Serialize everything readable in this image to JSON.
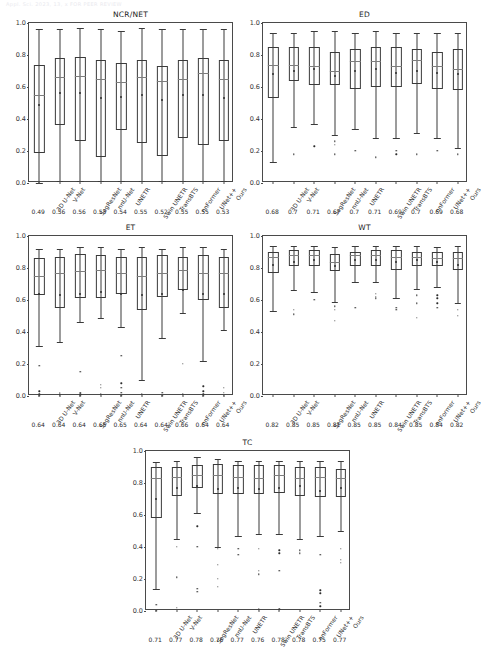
{
  "page": {
    "header_text": "Appl. Sci.  2023, 13, x FOR PEER REVIEW",
    "y_ticks": [
      "0.0",
      "0.2",
      "0.4",
      "0.6",
      "0.8",
      "1.0"
    ]
  },
  "methods": [
    "3D U-Net",
    "V-Net",
    "SegResNet",
    "nnU-Net",
    "UNETR",
    "Swin UNETR",
    "TransBTS",
    "nnFormer",
    "UNet++",
    "Ours"
  ],
  "chart_data": [
    {
      "type": "box",
      "title": "NCR/NET",
      "xlabel": "",
      "ylabel": "",
      "ylim": [
        0.0,
        1.0
      ],
      "yticks": [
        0.0,
        0.2,
        0.4,
        0.6,
        0.8,
        1.0
      ],
      "grid": false,
      "legend": "none",
      "categories": [
        "3D U-Net",
        "V-Net",
        "SegResNet",
        "nnU-Net",
        "UNETR",
        "Swin UNETR",
        "TransBTS",
        "nnFormer",
        "UNet++",
        "Ours"
      ],
      "mean_labels": [
        "0.49",
        "0.56",
        "0.56",
        "0.53",
        "0.54",
        "0.55",
        "0.52",
        "0.55",
        "0.55",
        "0.53"
      ],
      "boxes": [
        {
          "whisker_low": 0.0,
          "q1": 0.19,
          "median": 0.55,
          "q3": 0.74,
          "whisker_high": 0.96,
          "mean": 0.49,
          "fliers": []
        },
        {
          "whisker_low": 0.01,
          "q1": 0.36,
          "median": 0.66,
          "q3": 0.78,
          "whisker_high": 0.96,
          "mean": 0.56,
          "fliers": []
        },
        {
          "whisker_low": 0.01,
          "q1": 0.26,
          "median": 0.67,
          "q3": 0.79,
          "whisker_high": 0.97,
          "mean": 0.56,
          "fliers": []
        },
        {
          "whisker_low": 0.01,
          "q1": 0.16,
          "median": 0.65,
          "q3": 0.77,
          "whisker_high": 0.96,
          "mean": 0.53,
          "fliers": []
        },
        {
          "whisker_low": 0.01,
          "q1": 0.33,
          "median": 0.63,
          "q3": 0.75,
          "whisker_high": 0.95,
          "mean": 0.54,
          "fliers": []
        },
        {
          "whisker_low": 0.01,
          "q1": 0.25,
          "median": 0.66,
          "q3": 0.77,
          "whisker_high": 0.97,
          "mean": 0.55,
          "fliers": []
        },
        {
          "whisker_low": 0.01,
          "q1": 0.17,
          "median": 0.64,
          "q3": 0.73,
          "whisker_high": 0.96,
          "mean": 0.52,
          "fliers": []
        },
        {
          "whisker_low": 0.01,
          "q1": 0.28,
          "median": 0.65,
          "q3": 0.77,
          "whisker_high": 0.96,
          "mean": 0.55,
          "fliers": []
        },
        {
          "whisker_low": 0.01,
          "q1": 0.24,
          "median": 0.69,
          "q3": 0.78,
          "whisker_high": 0.96,
          "mean": 0.55,
          "fliers": []
        },
        {
          "whisker_low": 0.01,
          "q1": 0.26,
          "median": 0.65,
          "q3": 0.77,
          "whisker_high": 0.96,
          "mean": 0.53,
          "fliers": []
        }
      ]
    },
    {
      "type": "box",
      "title": "ED",
      "xlabel": "",
      "ylabel": "",
      "ylim": [
        0.0,
        1.0
      ],
      "yticks": [
        0.0,
        0.2,
        0.4,
        0.6,
        0.8,
        1.0
      ],
      "grid": false,
      "legend": "none",
      "categories": [
        "3D U-Net",
        "V-Net",
        "SegResNet",
        "nnU-Net",
        "UNETR",
        "Swin UNETR",
        "TransBTS",
        "nnFormer",
        "UNet++",
        "Ours"
      ],
      "mean_labels": [
        "0.68",
        "0.7",
        "0.71",
        "0.67",
        "0.7",
        "0.71",
        "0.69",
        "0.7",
        "0.69",
        "0.68"
      ],
      "boxes": [
        {
          "whisker_low": 0.13,
          "q1": 0.53,
          "median": 0.74,
          "q3": 0.85,
          "whisker_high": 0.94,
          "mean": 0.68,
          "fliers": []
        },
        {
          "whisker_low": 0.35,
          "q1": 0.64,
          "median": 0.74,
          "q3": 0.85,
          "whisker_high": 0.94,
          "mean": 0.7,
          "fliers": [
            0.18
          ]
        },
        {
          "whisker_low": 0.37,
          "q1": 0.61,
          "median": 0.73,
          "q3": 0.85,
          "whisker_high": 0.95,
          "mean": 0.71,
          "fliers": [
            0.23
          ]
        },
        {
          "whisker_low": 0.3,
          "q1": 0.61,
          "median": 0.7,
          "q3": 0.82,
          "whisker_high": 0.95,
          "mean": 0.67,
          "fliers": [
            0.26,
            0.24,
            0.18
          ]
        },
        {
          "whisker_low": 0.34,
          "q1": 0.59,
          "median": 0.76,
          "q3": 0.84,
          "whisker_high": 0.94,
          "mean": 0.7,
          "fliers": [
            0.2
          ]
        },
        {
          "whisker_low": 0.28,
          "q1": 0.6,
          "median": 0.76,
          "q3": 0.85,
          "whisker_high": 0.95,
          "mean": 0.71,
          "fliers": [
            0.16
          ]
        },
        {
          "whisker_low": 0.28,
          "q1": 0.6,
          "median": 0.73,
          "q3": 0.85,
          "whisker_high": 0.94,
          "mean": 0.69,
          "fliers": [
            0.2,
            0.18
          ]
        },
        {
          "whisker_low": 0.31,
          "q1": 0.62,
          "median": 0.77,
          "q3": 0.84,
          "whisker_high": 0.94,
          "mean": 0.7,
          "fliers": [
            0.18
          ]
        },
        {
          "whisker_low": 0.28,
          "q1": 0.59,
          "median": 0.73,
          "q3": 0.82,
          "whisker_high": 0.94,
          "mean": 0.69,
          "fliers": [
            0.2
          ]
        },
        {
          "whisker_low": 0.22,
          "q1": 0.58,
          "median": 0.71,
          "q3": 0.84,
          "whisker_high": 0.94,
          "mean": 0.68,
          "fliers": [
            0.18
          ]
        }
      ]
    },
    {
      "type": "box",
      "title": "ET",
      "xlabel": "",
      "ylabel": "",
      "ylim": [
        0.0,
        1.0
      ],
      "yticks": [
        0.0,
        0.2,
        0.4,
        0.6,
        0.8,
        1.0
      ],
      "grid": false,
      "legend": "none",
      "categories": [
        "3D U-Net",
        "V-Net",
        "SegResNet",
        "nnU-Net",
        "UNETR",
        "Swin UNETR",
        "TransBTS",
        "nnFormer",
        "UNet++",
        "Ours"
      ],
      "mean_labels": [
        "0.64",
        "0.64",
        "0.64",
        "0.65",
        "0.65",
        "0.64",
        "0.64",
        "0.66",
        "0.64",
        "0.64"
      ],
      "boxes": [
        {
          "whisker_low": 0.31,
          "q1": 0.63,
          "median": 0.75,
          "q3": 0.86,
          "whisker_high": 0.92,
          "mean": 0.64,
          "fliers": [
            0.19,
            0.03,
            0.01,
            0.0
          ]
        },
        {
          "whisker_low": 0.34,
          "q1": 0.55,
          "median": 0.77,
          "q3": 0.87,
          "whisker_high": 0.92,
          "mean": 0.63,
          "fliers": [
            0.02,
            0.01,
            0.0
          ]
        },
        {
          "whisker_low": 0.46,
          "q1": 0.61,
          "median": 0.78,
          "q3": 0.89,
          "whisker_high": 0.93,
          "mean": 0.64,
          "fliers": [
            0.15,
            0.02,
            0.01,
            0.0
          ]
        },
        {
          "whisker_low": 0.49,
          "q1": 0.61,
          "median": 0.79,
          "q3": 0.88,
          "whisker_high": 0.93,
          "mean": 0.65,
          "fliers": [
            0.07,
            0.05,
            0.01
          ]
        },
        {
          "whisker_low": 0.43,
          "q1": 0.64,
          "median": 0.77,
          "q3": 0.87,
          "whisker_high": 0.92,
          "mean": 0.64,
          "fliers": [
            0.25,
            0.08,
            0.05,
            0.02,
            0.0
          ]
        },
        {
          "whisker_low": 0.1,
          "q1": 0.54,
          "median": 0.75,
          "q3": 0.87,
          "whisker_high": 0.93,
          "mean": 0.63,
          "fliers": [
            0.01
          ]
        },
        {
          "whisker_low": 0.36,
          "q1": 0.62,
          "median": 0.77,
          "q3": 0.88,
          "whisker_high": 0.92,
          "mean": 0.64,
          "fliers": [
            0.02,
            0.0
          ]
        },
        {
          "whisker_low": 0.52,
          "q1": 0.66,
          "median": 0.79,
          "q3": 0.87,
          "whisker_high": 0.93,
          "mean": 0.66,
          "fliers": [
            0.2,
            0.01
          ]
        },
        {
          "whisker_low": 0.22,
          "q1": 0.6,
          "median": 0.77,
          "q3": 0.88,
          "whisker_high": 0.93,
          "mean": 0.64,
          "fliers": [
            0.06,
            0.03,
            0.01,
            0.0
          ]
        },
        {
          "whisker_low": 0.41,
          "q1": 0.55,
          "median": 0.77,
          "q3": 0.87,
          "whisker_high": 0.92,
          "mean": 0.64,
          "fliers": [
            0.05,
            0.02,
            0.0
          ]
        }
      ]
    },
    {
      "type": "box",
      "title": "WT",
      "xlabel": "",
      "ylabel": "",
      "ylim": [
        0.0,
        1.0
      ],
      "yticks": [
        0.0,
        0.2,
        0.4,
        0.6,
        0.8,
        1.0
      ],
      "grid": false,
      "legend": "none",
      "categories": [
        "3D U-Net",
        "V-Net",
        "SegResNet",
        "nnU-Net",
        "UNETR",
        "Swin UNETR",
        "TransBTS",
        "nnFormer",
        "UNet++",
        "Ours"
      ],
      "mean_labels": [
        "0.82",
        "0.85",
        "0.85",
        "0.81",
        "0.85",
        "0.85",
        "0.84",
        "0.85",
        "0.84",
        "0.82"
      ],
      "boxes": [
        {
          "whisker_low": 0.53,
          "q1": 0.77,
          "median": 0.87,
          "q3": 0.9,
          "whisker_high": 0.94,
          "mean": 0.82,
          "fliers": []
        },
        {
          "whisker_low": 0.66,
          "q1": 0.81,
          "median": 0.88,
          "q3": 0.91,
          "whisker_high": 0.94,
          "mean": 0.84,
          "fliers": [
            0.54,
            0.51
          ]
        },
        {
          "whisker_low": 0.65,
          "q1": 0.81,
          "median": 0.88,
          "q3": 0.91,
          "whisker_high": 0.94,
          "mean": 0.85,
          "fliers": [
            0.6
          ]
        },
        {
          "whisker_low": 0.59,
          "q1": 0.78,
          "median": 0.84,
          "q3": 0.89,
          "whisker_high": 0.93,
          "mean": 0.81,
          "fliers": [
            0.56,
            0.54,
            0.47
          ]
        },
        {
          "whisker_low": 0.71,
          "q1": 0.81,
          "median": 0.88,
          "q3": 0.9,
          "whisker_high": 0.94,
          "mean": 0.85,
          "fliers": [
            0.55
          ]
        },
        {
          "whisker_low": 0.71,
          "q1": 0.81,
          "median": 0.88,
          "q3": 0.91,
          "whisker_high": 0.94,
          "mean": 0.85,
          "fliers": [
            0.64,
            0.62,
            0.61
          ]
        },
        {
          "whisker_low": 0.61,
          "q1": 0.79,
          "median": 0.87,
          "q3": 0.91,
          "whisker_high": 0.94,
          "mean": 0.84,
          "fliers": [
            0.55,
            0.54
          ]
        },
        {
          "whisker_low": 0.67,
          "q1": 0.81,
          "median": 0.87,
          "q3": 0.9,
          "whisker_high": 0.94,
          "mean": 0.85,
          "fliers": [
            0.63,
            0.58,
            0.49
          ]
        },
        {
          "whisker_low": 0.68,
          "q1": 0.81,
          "median": 0.86,
          "q3": 0.9,
          "whisker_high": 0.93,
          "mean": 0.84,
          "fliers": [
            0.63,
            0.61,
            0.58,
            0.55
          ]
        },
        {
          "whisker_low": 0.58,
          "q1": 0.79,
          "median": 0.86,
          "q3": 0.9,
          "whisker_high": 0.94,
          "mean": 0.82,
          "fliers": [
            0.54,
            0.5
          ]
        }
      ]
    },
    {
      "type": "box",
      "title": "TC",
      "xlabel": "",
      "ylabel": "",
      "ylim": [
        0.0,
        1.0
      ],
      "yticks": [
        0.0,
        0.2,
        0.4,
        0.6,
        0.8,
        1.0
      ],
      "grid": false,
      "legend": "none",
      "categories": [
        "3D U-Net",
        "V-Net",
        "SegResNet",
        "nnU-Net",
        "UNETR",
        "Swin UNETR",
        "TransBTS",
        "nnFormer",
        "UNet++",
        "Ours"
      ],
      "mean_labels": [
        "0.71",
        "0.77",
        "0.78",
        "0.76",
        "0.77",
        "0.76",
        "0.78",
        "0.78",
        "0.75",
        "0.77"
      ],
      "boxes": [
        {
          "whisker_low": 0.14,
          "q1": 0.58,
          "median": 0.83,
          "q3": 0.9,
          "whisker_high": 0.93,
          "mean": 0.7,
          "fliers": [
            0.04,
            0.0
          ]
        },
        {
          "whisker_low": 0.45,
          "q1": 0.72,
          "median": 0.84,
          "q3": 0.9,
          "whisker_high": 0.94,
          "mean": 0.77,
          "fliers": [
            0.4,
            0.21,
            0.02
          ]
        },
        {
          "whisker_low": 0.61,
          "q1": 0.77,
          "median": 0.85,
          "q3": 0.91,
          "whisker_high": 0.96,
          "mean": 0.78,
          "fliers": [
            0.53,
            0.4,
            0.14,
            0.12
          ]
        },
        {
          "whisker_low": 0.4,
          "q1": 0.73,
          "median": 0.85,
          "q3": 0.92,
          "whisker_high": 0.95,
          "mean": 0.76,
          "fliers": [
            0.39,
            0.29,
            0.2,
            0.15
          ]
        },
        {
          "whisker_low": 0.47,
          "q1": 0.73,
          "median": 0.84,
          "q3": 0.91,
          "whisker_high": 0.94,
          "mean": 0.77,
          "fliers": [
            0.39,
            0.35
          ]
        },
        {
          "whisker_low": 0.48,
          "q1": 0.73,
          "median": 0.83,
          "q3": 0.91,
          "whisker_high": 0.94,
          "mean": 0.76,
          "fliers": [
            0.39,
            0.25,
            0.23,
            0.01
          ]
        },
        {
          "whisker_low": 0.48,
          "q1": 0.74,
          "median": 0.85,
          "q3": 0.91,
          "whisker_high": 0.94,
          "mean": 0.77,
          "fliers": [
            0.38,
            0.36,
            0.25,
            0.01
          ]
        },
        {
          "whisker_low": 0.45,
          "q1": 0.72,
          "median": 0.83,
          "q3": 0.9,
          "whisker_high": 0.94,
          "mean": 0.78,
          "fliers": [
            0.38,
            0.36
          ]
        },
        {
          "whisker_low": 0.47,
          "q1": 0.71,
          "median": 0.84,
          "q3": 0.9,
          "whisker_high": 0.94,
          "mean": 0.75,
          "fliers": [
            0.35,
            0.13,
            0.11,
            0.05,
            0.03
          ]
        },
        {
          "whisker_low": 0.5,
          "q1": 0.71,
          "median": 0.83,
          "q3": 0.89,
          "whisker_high": 0.94,
          "mean": 0.77,
          "fliers": [
            0.39,
            0.32,
            0.3
          ]
        }
      ]
    }
  ]
}
